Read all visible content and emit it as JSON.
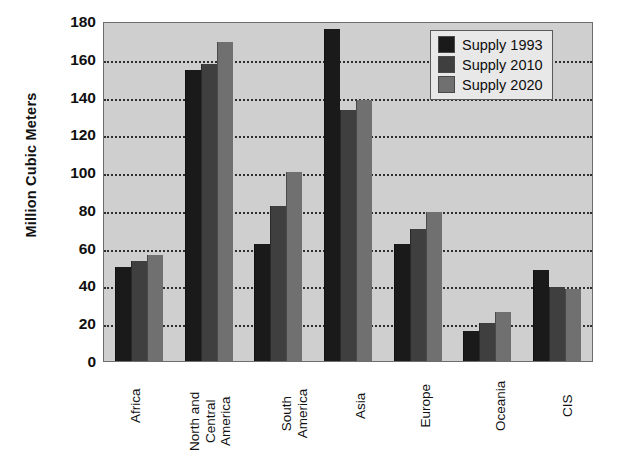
{
  "chart_data": {
    "type": "bar",
    "title": "",
    "xlabel": "",
    "ylabel": "Million Cubic Meters",
    "ylim": [
      0,
      180
    ],
    "ytick_values": [
      0,
      20,
      40,
      60,
      80,
      100,
      120,
      140,
      160,
      180
    ],
    "ytick_labels": [
      "0",
      "20",
      "40",
      "60",
      "80",
      "100",
      "120",
      "140",
      "160",
      "180"
    ],
    "grid": true,
    "grid_axis": "y",
    "legend_position": "top-right",
    "categories": [
      "Africa",
      "North and Central America",
      "South America",
      "Asia",
      "Europe",
      "Oceania",
      "CIS"
    ],
    "category_label_lines": [
      [
        "Africa"
      ],
      [
        "North and",
        "Central",
        "America"
      ],
      [
        "South",
        "America"
      ],
      [
        "Asia"
      ],
      [
        "Europe"
      ],
      [
        "Oceania"
      ],
      [
        "CIS"
      ]
    ],
    "series": [
      {
        "name": "Supply 1993",
        "color": "#1a1a1a",
        "values": [
          50,
          154,
          62,
          176,
          62,
          16,
          48
        ]
      },
      {
        "name": "Supply 2010",
        "color": "#3f3f3f",
        "values": [
          53,
          157,
          82,
          133,
          70,
          20,
          39
        ]
      },
      {
        "name": "Supply 2020",
        "color": "#707070",
        "values": [
          56,
          169,
          100,
          138,
          79,
          26,
          38
        ]
      }
    ]
  },
  "style": {
    "plot_background": "#cfcfcf",
    "figure_background": "#ffffff",
    "gridline_color": "#2e2e2e",
    "axis_color": "#6d6d6d",
    "text_color": "#101010"
  }
}
